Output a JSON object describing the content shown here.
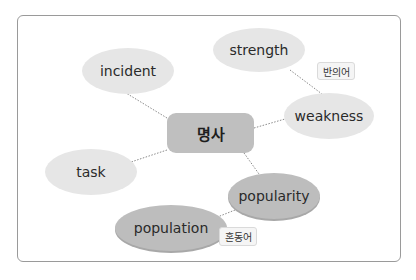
{
  "diagram": {
    "center": {
      "label": "명사"
    },
    "nodes": [
      {
        "id": "incident",
        "label": "incident",
        "shade": "light"
      },
      {
        "id": "strength",
        "label": "strength",
        "shade": "light"
      },
      {
        "id": "weakness",
        "label": "weakness",
        "shade": "light"
      },
      {
        "id": "task",
        "label": "task",
        "shade": "light"
      },
      {
        "id": "popularity",
        "label": "popularity",
        "shade": "dark"
      },
      {
        "id": "population",
        "label": "population",
        "shade": "dark"
      }
    ],
    "relations": [
      {
        "from": "strength",
        "to": "weakness",
        "label": "반의어"
      },
      {
        "from": "popularity",
        "to": "population",
        "label": "혼동어"
      }
    ],
    "edges": [
      [
        "명사",
        "incident"
      ],
      [
        "명사",
        "weakness"
      ],
      [
        "명사",
        "task"
      ],
      [
        "명사",
        "popularity"
      ],
      [
        "strength",
        "weakness"
      ],
      [
        "popularity",
        "population"
      ]
    ],
    "colors": {
      "light_node": "#e6e6e6",
      "dark_node": "#bdbdbd",
      "center_node": "#bfbfbf",
      "frame_border": "#9a9a9a",
      "edge": "#8a8a8a"
    }
  }
}
